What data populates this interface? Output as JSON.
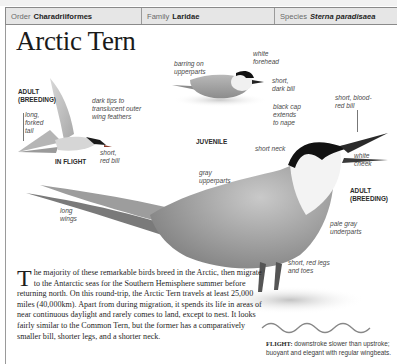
{
  "header": {
    "order_label": "Order",
    "order_value": "Charadriiformes",
    "family_label": "Family",
    "family_value": "Laridae",
    "species_label": "Species",
    "species_value": "Sterna paradisaea"
  },
  "title": "Arctic Tern",
  "illustrations": {
    "in_flight": {
      "caption": "IN FLIGHT",
      "plumage": "ADULT\n(BREEDING)",
      "labels": [
        "long,\nforked\ntail",
        "dark tips to\ntranslucent outer\nwing feathers",
        "short,\nred bill"
      ]
    },
    "juvenile": {
      "caption": "JUVENILE",
      "labels": [
        "barring on\nupperparts",
        "white\nforehead",
        "short,\ndark bill"
      ]
    },
    "adult": {
      "caption": "ADULT\n(BREEDING)",
      "labels": [
        "black cap\nextends\nto nape",
        "short, blood-\nred bill",
        "short neck",
        "white\ncheek",
        "gray\nupperparts",
        "long\nwings",
        "pale gray\nunderparts",
        "short, red legs\nand toes"
      ]
    }
  },
  "description": {
    "dropcap": "T",
    "text": "he majority of these remarkable birds breed in the Arctic, then migrate to the Antarctic seas for the Southern Hemisphere summer before returning north. On this round-trip, the Arctic Tern travels at least 25,000 miles (40,000km). Apart from during migration, it spends its life in areas of near continuous daylight and rarely comes to land, except to nest. It looks fairly similar to the Common Tern, but the former has a comparatively smaller bill, shorter legs, and a shorter neck."
  },
  "flight_note": {
    "label": "FLIGHT:",
    "text": "downstroke slower than upstroke; buoyant and elegant with regular wingbeats."
  },
  "colors": {
    "header_bg": "#e6e6e6",
    "border": "#8a8a8a",
    "text": "#1e1e1e",
    "label": "#4a4a4a"
  }
}
